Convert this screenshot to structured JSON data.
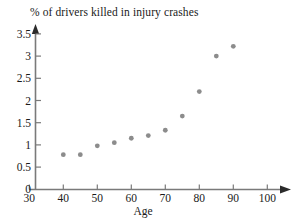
{
  "chart_data": {
    "type": "scatter",
    "title": "% of drivers killed in injury crashes",
    "xlabel": "Age",
    "ylabel": "",
    "xlim": [
      30,
      103
    ],
    "ylim": [
      0,
      3.65
    ],
    "grid": false,
    "legend": "none",
    "marker_color": "#8c8c8c",
    "x": [
      40,
      45,
      50,
      55,
      60,
      65,
      70,
      75,
      80,
      85,
      90
    ],
    "values": [
      0.78,
      0.78,
      0.98,
      1.05,
      1.15,
      1.21,
      1.33,
      1.65,
      2.2,
      3.0,
      3.22
    ],
    "xticks": [
      30,
      40,
      50,
      60,
      70,
      80,
      90,
      100
    ],
    "xtick_labels": [
      "30",
      "40",
      "50",
      "60",
      "70",
      "80",
      "90",
      "100"
    ],
    "yticks": [
      0,
      0.5,
      1,
      1.5,
      2,
      2.5,
      3,
      3.5
    ],
    "ytick_labels": [
      "0",
      "0.5",
      "1",
      "1.5",
      "2",
      "2.5",
      "3",
      "3.5"
    ],
    "points": [
      {
        "x": 40,
        "y": 0.78
      },
      {
        "x": 45,
        "y": 0.78
      },
      {
        "x": 50,
        "y": 0.98
      },
      {
        "x": 55,
        "y": 1.05
      },
      {
        "x": 60,
        "y": 1.15
      },
      {
        "x": 65,
        "y": 1.21
      },
      {
        "x": 70,
        "y": 1.33
      },
      {
        "x": 75,
        "y": 1.65
      },
      {
        "x": 80,
        "y": 2.2
      },
      {
        "x": 85,
        "y": 3.0
      },
      {
        "x": 90,
        "y": 3.22
      }
    ]
  },
  "colors": {
    "axis": "#7a7a7a",
    "marker": "#8c8c8c",
    "text": "#1a1a1a",
    "background": "#ffffff"
  }
}
